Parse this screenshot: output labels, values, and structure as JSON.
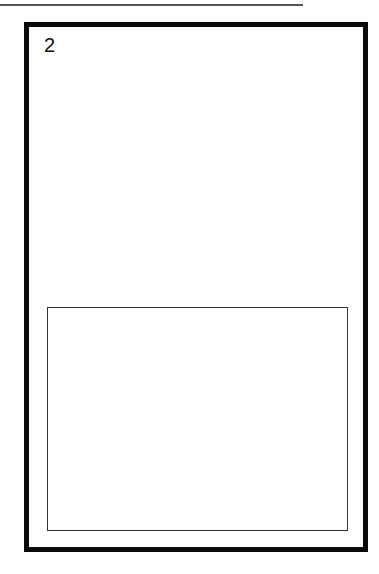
{
  "page": {
    "number": "2",
    "top_rule": true,
    "frame": {
      "outer_border_color": "#0a0a0a",
      "inner_border_color": "#333333"
    },
    "inner_box": {
      "content": ""
    }
  }
}
